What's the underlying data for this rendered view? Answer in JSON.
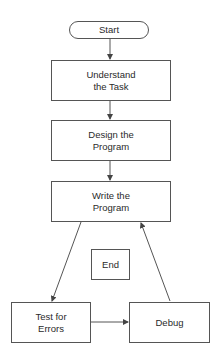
{
  "diagram": {
    "type": "flowchart",
    "nodes": [
      {
        "id": "start",
        "shape": "terminator",
        "label": "Start"
      },
      {
        "id": "understand",
        "shape": "process",
        "label": "Understand\nthe Task"
      },
      {
        "id": "design",
        "shape": "process",
        "label": "Design the\nProgram"
      },
      {
        "id": "write",
        "shape": "process",
        "label": "Write the\nProgram"
      },
      {
        "id": "end",
        "shape": "process",
        "label": "End"
      },
      {
        "id": "test",
        "shape": "process",
        "label": "Test for\nErrors"
      },
      {
        "id": "debug",
        "shape": "process",
        "label": "Debug"
      }
    ],
    "edges": [
      {
        "from": "start",
        "to": "understand"
      },
      {
        "from": "understand",
        "to": "design"
      },
      {
        "from": "design",
        "to": "write"
      },
      {
        "from": "write",
        "to": "test"
      },
      {
        "from": "test",
        "to": "debug"
      },
      {
        "from": "debug",
        "to": "write"
      }
    ],
    "colors": {
      "line": "#555555",
      "text": "#2a2a2a",
      "background": "#ffffff"
    }
  }
}
